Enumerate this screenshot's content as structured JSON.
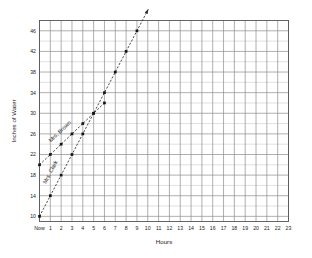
{
  "chart_data": {
    "type": "line",
    "title": "",
    "xlabel": "Hours",
    "ylabel": "Inches of Water",
    "grid": true,
    "legend": "inline-labels",
    "x_tick_labels": [
      "Now",
      "1",
      "2",
      "3",
      "4",
      "5",
      "6",
      "7",
      "8",
      "9",
      "10",
      "11",
      "12",
      "13",
      "14",
      "15",
      "16",
      "17",
      "18",
      "19",
      "20",
      "21",
      "22",
      "23"
    ],
    "x_values": [
      0,
      1,
      2,
      3,
      4,
      5,
      6,
      7,
      8,
      9,
      10,
      11,
      12,
      13,
      14,
      15,
      16,
      17,
      18,
      19,
      20,
      21,
      22,
      23
    ],
    "xlim": [
      0,
      23
    ],
    "ylim": [
      9,
      48
    ],
    "y_major_ticks": [
      10,
      14,
      18,
      22,
      26,
      30,
      34,
      38,
      42,
      46
    ],
    "y_minor_step": 2,
    "y_tick_labels": [
      "10",
      "14",
      "18",
      "22",
      "26",
      "30",
      "34",
      "38",
      "42",
      "46"
    ],
    "series": [
      {
        "name": "Mrs. Brown",
        "label_x": 2.0,
        "label_y": 26.2,
        "slope_per_hour": 2,
        "start_value": 20,
        "x": [
          0,
          1,
          2,
          3,
          4,
          5,
          6
        ],
        "values": [
          20,
          22,
          24,
          26,
          28,
          30,
          32
        ],
        "arrow": false,
        "style": "dashed"
      },
      {
        "name": "Mrs. Clark",
        "label_x": 1.15,
        "label_y": 18.4,
        "slope_per_hour": 4,
        "start_value": 10,
        "x": [
          0,
          1,
          2,
          3,
          4,
          5,
          6,
          7,
          8,
          9
        ],
        "values": [
          10,
          14,
          18,
          22,
          26,
          30,
          34,
          38,
          42,
          46
        ],
        "arrow": true,
        "arrow_to_x": 10.05,
        "arrow_to_y": 50.2,
        "style": "dashed"
      }
    ],
    "intersection": {
      "x": 5,
      "y": 30
    },
    "colors": {
      "line": "#2a2a2a",
      "marker": "#151515",
      "grid_minor": "#b9b9b9",
      "grid_major": "#8d8d8d",
      "frame": "#555555",
      "background": "#ffffff",
      "text": "#1a1a1a"
    }
  }
}
